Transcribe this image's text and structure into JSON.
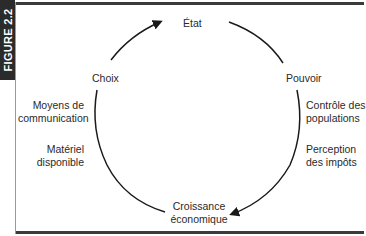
{
  "figure": {
    "tab_label": "FIGURE 2.2"
  },
  "diagram": {
    "type": "cycle",
    "nodes": {
      "top": "État",
      "right": "Pouvoir",
      "bottom_line1": "Croissance",
      "bottom_line2": "économique",
      "left": "Choix"
    },
    "annotations": {
      "left_upper_line1": "Moyens de",
      "left_upper_line2": "communication",
      "left_lower_line1": "Matériel",
      "left_lower_line2": "disponible",
      "right_upper_line1": "Contrôle des",
      "right_upper_line2": "populations",
      "right_lower_line1": "Perception",
      "right_lower_line2": "des impôts"
    },
    "edges": [
      {
        "from": "Choix",
        "to": "État",
        "arrow": true
      },
      {
        "from": "État",
        "to": "Pouvoir",
        "arrow": false
      },
      {
        "from": "Pouvoir",
        "to": "Croissance économique",
        "arrow": true
      },
      {
        "from": "Croissance économique",
        "to": "Choix",
        "arrow": false
      }
    ],
    "colors": {
      "line": "#1a1a1a",
      "tab_bg": "#2b2b2b",
      "tab_text": "#ffffff"
    }
  }
}
